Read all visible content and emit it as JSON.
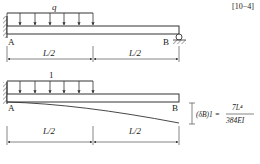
{
  "header": {
    "clipped_text": "[10−4]"
  },
  "figure_top": {
    "load_label": "q",
    "support_left": "A",
    "support_right": "B",
    "dim_left": "L/2",
    "dim_right": "L/2"
  },
  "figure_bottom": {
    "load_label": "1",
    "support_left": "A",
    "support_right": "B",
    "dim_left": "L/2",
    "dim_right": "L/2",
    "deflection_label": "(δB)1 =",
    "formula_numerator": "7L⁴",
    "formula_denominator": "384EI"
  }
}
